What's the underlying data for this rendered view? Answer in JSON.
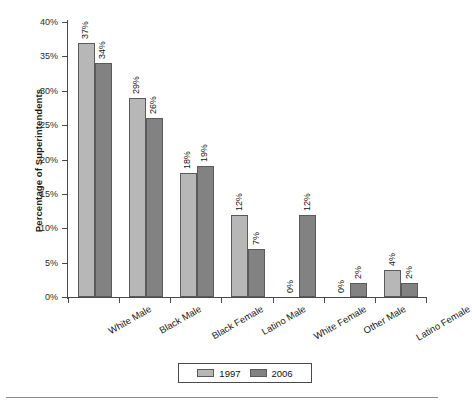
{
  "chart_data": {
    "type": "bar",
    "title": "",
    "subtitle": "",
    "xlabel": "",
    "ylabel": "Percentage of Superintendents",
    "ylim": [
      0,
      40
    ],
    "ytick_labels": [
      "0%",
      "5%",
      "10%",
      "15%",
      "20%",
      "25%",
      "30%",
      "35%",
      "40%"
    ],
    "ytick_values": [
      0,
      5,
      10,
      15,
      20,
      25,
      30,
      35,
      40
    ],
    "grid": false,
    "legend_position": "bottom-center",
    "value_label_suffix": "%",
    "categories": [
      "White Male",
      "Black Male",
      "Black Female",
      "Latino Male",
      "White Female",
      "Other Male",
      "Latino Female"
    ],
    "series": [
      {
        "name": "1997",
        "color": "#b7b7b7",
        "values": [
          37,
          29,
          18,
          12,
          0,
          0,
          4
        ],
        "labels": [
          "37%",
          "29%",
          "18%",
          "12%",
          "0%",
          "0%",
          "4%"
        ]
      },
      {
        "name": "2006",
        "color": "#828282",
        "values": [
          34,
          26,
          19,
          7,
          12,
          2,
          2
        ],
        "labels": [
          "34%",
          "26%",
          "19%",
          "7%",
          "12%",
          "2%",
          "2%"
        ]
      }
    ]
  },
  "legend": {
    "items": [
      {
        "label": "1997",
        "color": "#b7b7b7"
      },
      {
        "label": "2006",
        "color": "#828282"
      }
    ]
  },
  "axis": {
    "y_title": "Percentage of Superintendents"
  }
}
